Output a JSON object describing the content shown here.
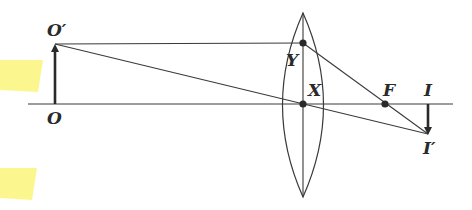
{
  "diagram": {
    "type": "convex-lens-ray-diagram",
    "colors": {
      "ink": "#3a3a3a",
      "highlight": "#fbf57a",
      "background": "#ffffff"
    },
    "labels": {
      "object_top": "O′",
      "object_base": "O",
      "lens_top_point": "Y",
      "lens_center": "X",
      "focal_point": "F",
      "image_base": "I",
      "image_tip": "I′"
    }
  }
}
